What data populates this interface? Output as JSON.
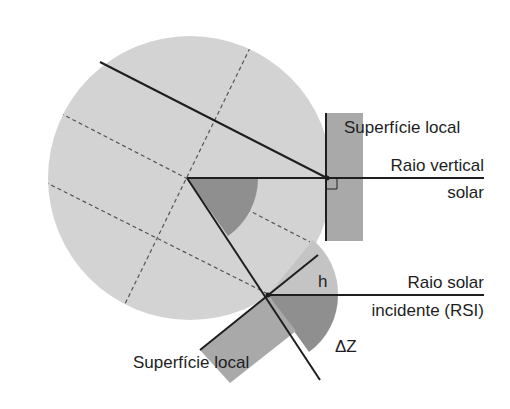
{
  "diagram": {
    "type": "solar-incidence-geometry",
    "labels": {
      "surface_top": "Superfície local",
      "vertical_ray_line1": "Raio vertical",
      "vertical_ray_line2": "solar",
      "incident_ray_line1": "Raio solar",
      "incident_ray_line2": "incidente (RSI)",
      "surface_bottom": "Superfície local",
      "angle_h": "h",
      "angle_delta_z": "ΔZ"
    },
    "colors": {
      "earth_fill": "#d3d3d3",
      "wedge_fill": "#8f8f8f",
      "surface_fill": "#a9a9a9",
      "line": "#1e1e1e",
      "dash": "#555555"
    },
    "geometry": {
      "earth_center": [
        190,
        178
      ],
      "earth_radius": 142,
      "vertical_ray_y": 178,
      "incident_ray_y": 295,
      "lower_point": [
        268,
        295
      ]
    }
  }
}
